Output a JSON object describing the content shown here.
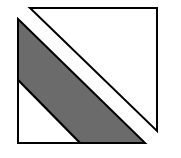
{
  "diagram": {
    "title": "",
    "colors": {
      "background": "#ffffff",
      "stroke": "#000000",
      "band_fill": "#6b6b6b",
      "white_fill": "#ffffff"
    },
    "shapes": {
      "upper_triangle": {
        "points": "30,8 157,8 157,131",
        "description": "white right triangle, top-right"
      },
      "lower_white_triangle": {
        "points": "18,80 18,143 80,143",
        "description": "white right triangle, bottom-left"
      },
      "gray_band": {
        "points": "18,19 145,143 80,143 18,80",
        "description": "dark gray diagonal band"
      }
    },
    "stroke_width": 2
  }
}
